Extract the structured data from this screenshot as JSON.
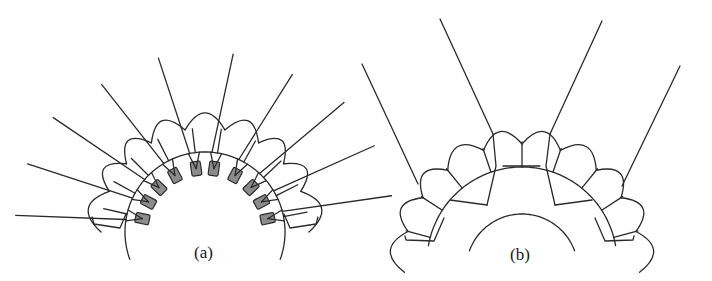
{
  "figure": {
    "panels": [
      {
        "id": "a",
        "caption": "(a)",
        "description": "Arch of rounded segmented blocks with 10 gray rectangular anchors along inner arc and long radial lines extending outward",
        "anchor_count": 10,
        "colors": {
          "line": "#2a2a2a",
          "anchor_fill": "#8c8c8c"
        }
      },
      {
        "id": "b",
        "caption": "(b)",
        "description": "Arch of rounded segmented blocks with inner semicircle, four long radial lines and internal connecting lines",
        "colors": {
          "line": "#2a2a2a"
        }
      }
    ]
  }
}
